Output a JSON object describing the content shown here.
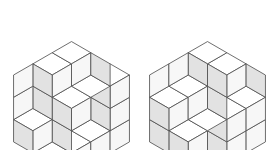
{
  "figure": {
    "caption_text": "",
    "background_color": "#ffffff",
    "stroke_color": "#4a4a4a",
    "stroke_width": 0.8,
    "face_colors": {
      "top": "#ffffff",
      "left": "#e2e2e2",
      "right": "#f7f7f7"
    },
    "canvas": {
      "width": 274,
      "height": 150
    }
  },
  "hexagons": [
    {
      "id": "hexagon-left",
      "label": "Left hexagon tiling",
      "center": {
        "x": 71.5,
        "y": 75
      },
      "order": 3,
      "rhombus_count": 27,
      "edge_px": 22.3,
      "bounds": {
        "left": 12,
        "right": 131,
        "top": 8,
        "bottom": 142
      },
      "height_map": [
        [
          3,
          3,
          1
        ],
        [
          2,
          2,
          0
        ],
        [
          3,
          1,
          1
        ]
      ]
    },
    {
      "id": "hexagon-right",
      "label": "Right hexagon tiling",
      "center": {
        "x": 207.5,
        "y": 75
      },
      "order": 3,
      "rhombus_count": 27,
      "edge_px": 22.3,
      "bounds": {
        "left": 148,
        "right": 267,
        "top": 8,
        "bottom": 142
      },
      "height_map": [
        [
          3,
          2,
          2
        ],
        [
          3,
          1,
          1
        ],
        [
          2,
          2,
          0
        ]
      ]
    }
  ]
}
